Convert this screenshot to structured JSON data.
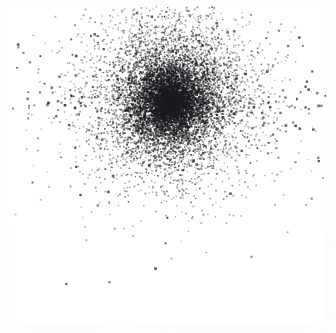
{
  "figure": {
    "title": "",
    "caption": "",
    "background_color": "#ffffff",
    "paper_color": "#fefefe",
    "width": 336,
    "height": 333
  },
  "plot_frame": {
    "name": "plot-border",
    "left": 9,
    "top": 5,
    "right": 326,
    "bottom": 326,
    "border_color": "#4a4a4f",
    "border_width": 2,
    "fill_color": "#ffffff",
    "has_ticks": false,
    "has_axis_labels": false,
    "has_gridlines": false,
    "has_legend": false
  },
  "chart_data": {
    "type": "scatter",
    "title": "",
    "subtitle": "",
    "xlabel": "",
    "ylabel": "",
    "xlim": [
      0,
      1
    ],
    "ylim": [
      0,
      1
    ],
    "grid": false,
    "legend_position": "none",
    "tick_labels_x": [],
    "tick_labels_y": [],
    "annotations": [],
    "point_color": "#1b1b1f",
    "point_size_px": 1.6,
    "point_count_estimate": 9000,
    "distribution": {
      "family": "gaussian-cluster",
      "center_x_px": 170,
      "center_y_px": 102,
      "sigma_x_px": 30,
      "sigma_y_px": 30,
      "core_radius_px": 16,
      "halo_radius_px": 78,
      "vertical_tail": true,
      "clipped_at_top_border": true
    },
    "layers": [
      {
        "name": "dense-core",
        "count": 2600,
        "sigma_x": 17,
        "sigma_y": 18,
        "opacity": 0.92,
        "size_px": 1.5
      },
      {
        "name": "mid-halo",
        "count": 3800,
        "sigma_x": 31,
        "sigma_y": 33,
        "opacity": 0.72,
        "size_px": 1.4
      },
      {
        "name": "outer-halo",
        "count": 2000,
        "sigma_x": 52,
        "sigma_y": 50,
        "opacity": 0.5,
        "size_px": 1.4
      },
      {
        "name": "sparse-outliers",
        "count": 360,
        "sigma_x": 88,
        "sigma_y": 60,
        "opacity": 0.85,
        "size_px": 2.0
      },
      {
        "name": "upper-tail",
        "count": 900,
        "sigma_x": 34,
        "sigma_y": 46,
        "opacity": 0.6,
        "size_px": 1.4
      }
    ],
    "series": [
      {
        "name": "points",
        "marker": "square",
        "color": "#1b1b1f",
        "x_center": 0.508,
        "y_center": 0.698,
        "spread": 0.1
      }
    ]
  }
}
